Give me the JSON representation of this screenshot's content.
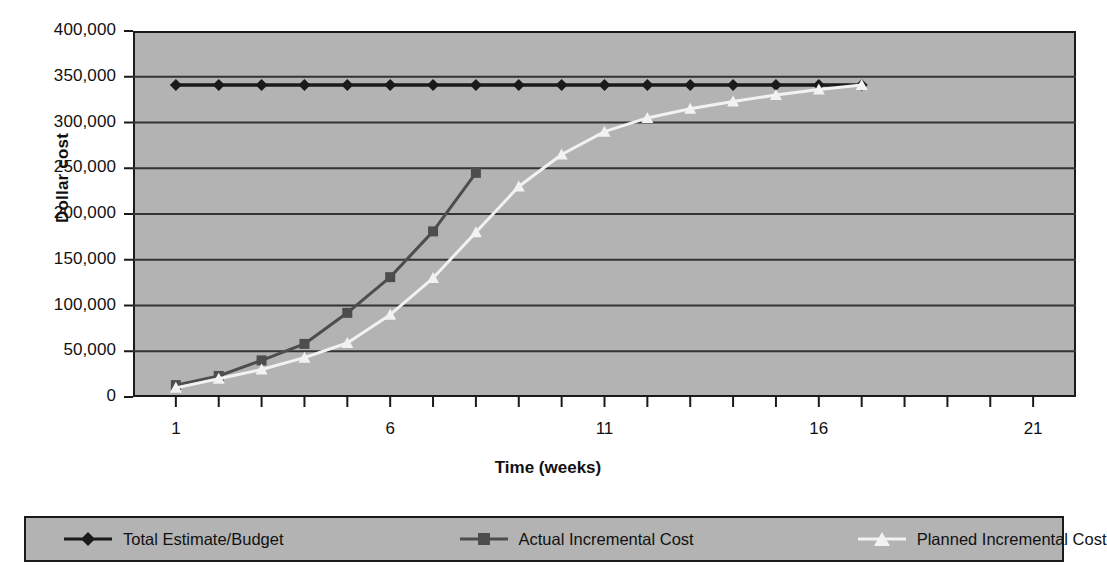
{
  "chart_data": {
    "type": "line",
    "title": "",
    "xlabel": "Time (weeks)",
    "ylabel": "Dollar cost",
    "xlim": [
      0,
      22
    ],
    "ylim": [
      0,
      400000
    ],
    "grid": true,
    "legend_position": "bottom",
    "x_tick_labels": [
      "1",
      "6",
      "11",
      "16",
      "21"
    ],
    "x_tick_values": [
      1,
      6,
      11,
      16,
      21
    ],
    "y_tick_labels": [
      "0",
      "50,000",
      "100,000",
      "150,000",
      "200,000",
      "250,000",
      "300,000",
      "350,000",
      "400,000"
    ],
    "y_tick_values": [
      0,
      50000,
      100000,
      150000,
      200000,
      250000,
      300000,
      350000,
      400000
    ],
    "x": [
      1,
      2,
      3,
      4,
      5,
      6,
      7,
      8,
      9,
      10,
      11,
      12,
      13,
      14,
      15,
      16,
      17
    ],
    "series": [
      {
        "name": "Total Estimate/Budget",
        "marker": "diamond",
        "color": "#1a1a1a",
        "x": [
          1,
          2,
          3,
          4,
          5,
          6,
          7,
          8,
          9,
          10,
          11,
          12,
          13,
          14,
          15,
          16,
          17
        ],
        "values": [
          341000,
          341000,
          341000,
          341000,
          341000,
          341000,
          341000,
          341000,
          341000,
          341000,
          341000,
          341000,
          341000,
          341000,
          341000,
          341000,
          341000
        ]
      },
      {
        "name": "Actual Incremental Cost",
        "marker": "square",
        "color": "#4d4d4d",
        "x": [
          1,
          2,
          3,
          4,
          5,
          6,
          7,
          8
        ],
        "values": [
          13000,
          23000,
          40000,
          58000,
          92000,
          131000,
          181000,
          245000
        ]
      },
      {
        "name": "Planned Incremental Cost",
        "marker": "triangle",
        "color": "#f2f2f2",
        "x": [
          1,
          2,
          3,
          4,
          5,
          6,
          7,
          8,
          9,
          10,
          11,
          12,
          13,
          14,
          15,
          16,
          17
        ],
        "values": [
          10000,
          20000,
          30000,
          43000,
          59000,
          90000,
          130000,
          180000,
          230000,
          265000,
          290000,
          305000,
          315000,
          323000,
          330000,
          336000,
          341000
        ]
      }
    ]
  },
  "axes": {
    "y_label": "Dollar cost",
    "x_label": "Time (weeks)",
    "y_ticks": [
      "400,000",
      "350,000",
      "300,000",
      "250,000",
      "200,000",
      "150,000",
      "100,000",
      "50,000",
      "0"
    ],
    "x_ticks": [
      "1",
      "6",
      "11",
      "16",
      "21"
    ]
  },
  "legend": {
    "items": [
      {
        "label": "Total Estimate/Budget",
        "color": "#1a1a1a",
        "marker": "diamond"
      },
      {
        "label": "Actual Incremental Cost",
        "color": "#4d4d4d",
        "marker": "square"
      },
      {
        "label": "Planned Incremental Cost",
        "color": "#f2f2f2",
        "marker": "triangle"
      }
    ]
  },
  "colors": {
    "plot_background": "#b3b3b3",
    "axis": "#1a1a1a",
    "gridline": "#333333",
    "page_background": "#ffffff"
  }
}
